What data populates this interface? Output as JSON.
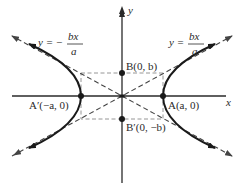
{
  "diagram": {
    "type": "hyperbola",
    "axes": {
      "x_label": "x",
      "y_label": "y"
    },
    "asymptotes": {
      "positive": {
        "lhs": "y =",
        "num": "bx",
        "den": "a"
      },
      "negative": {
        "lhs": "y = −",
        "num": "bx",
        "den": "a"
      }
    },
    "points": {
      "A": {
        "label": "A(a, 0)"
      },
      "A_prime": {
        "label": "A′(−a, 0)"
      },
      "B": {
        "label": "B(0, b)"
      },
      "B_prime": {
        "label": "B′(0, −b)"
      }
    },
    "colors": {
      "curve": "#1a1a1a",
      "axis": "#2a2a2a",
      "dashed": "#555555",
      "rectangle": "#888888",
      "text": "#2a2a2a"
    }
  }
}
